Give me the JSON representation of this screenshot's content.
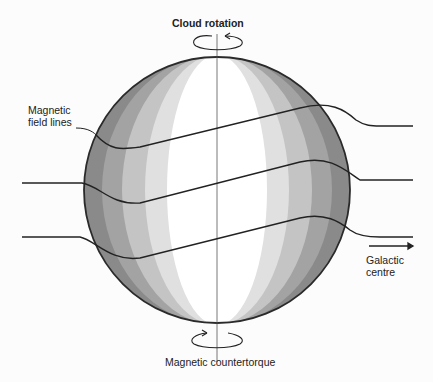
{
  "diagram": {
    "labels": {
      "top": "Cloud rotation",
      "bottom": "Magnetic countertorque",
      "field_lines_1": "Magnetic",
      "field_lines_2": "field lines",
      "direction_1": "Galactic",
      "direction_2": "centre"
    },
    "colors": {
      "outline": "#2a2a2a",
      "band_outer": "#8a8a8a",
      "band_2": "#a8a8a8",
      "band_3": "#c8c8c8",
      "band_4": "#e2e2e2",
      "core": "#ffffff"
    },
    "elements": [
      "sphere (molecular cloud)",
      "rotation axis",
      "3 magnetic field lines",
      "rotation arrow top",
      "countertorque arrow bottom",
      "galactic-centre arrow"
    ]
  }
}
